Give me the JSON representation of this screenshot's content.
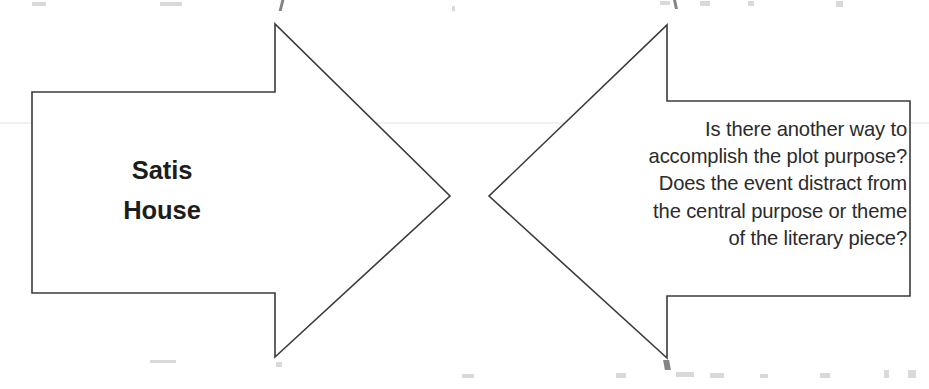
{
  "page": {
    "background_color": "#ffffff",
    "width": 929,
    "height": 389
  },
  "diagram": {
    "type": "two-opposing-block-arrows",
    "stroke_color": "#3b3b3b",
    "fill_color": "#ffffff",
    "stroke_width": 1.6,
    "left_arrow": {
      "name": "Satis House arrow",
      "direction": "right",
      "label_lines": [
        "Satis",
        "House"
      ],
      "label_weight": "bold",
      "label_color": "#1d1d1d",
      "label_align": "center",
      "points": "32,92 275,92 275,24 450,196 275,357 275,293 32,293"
    },
    "right_arrow": {
      "name": "Question arrow",
      "direction": "left",
      "label_lines": [
        "Is there another way to",
        "accomplish the plot purpose?",
        "Does the event distract from",
        "the central purpose or theme",
        "of the literary piece?"
      ],
      "label_weight": "normal",
      "label_color": "#2b2b2b",
      "label_align": "right",
      "points": "910,101 667,101 667,25 489,196 667,358 667,296 910,296"
    }
  }
}
